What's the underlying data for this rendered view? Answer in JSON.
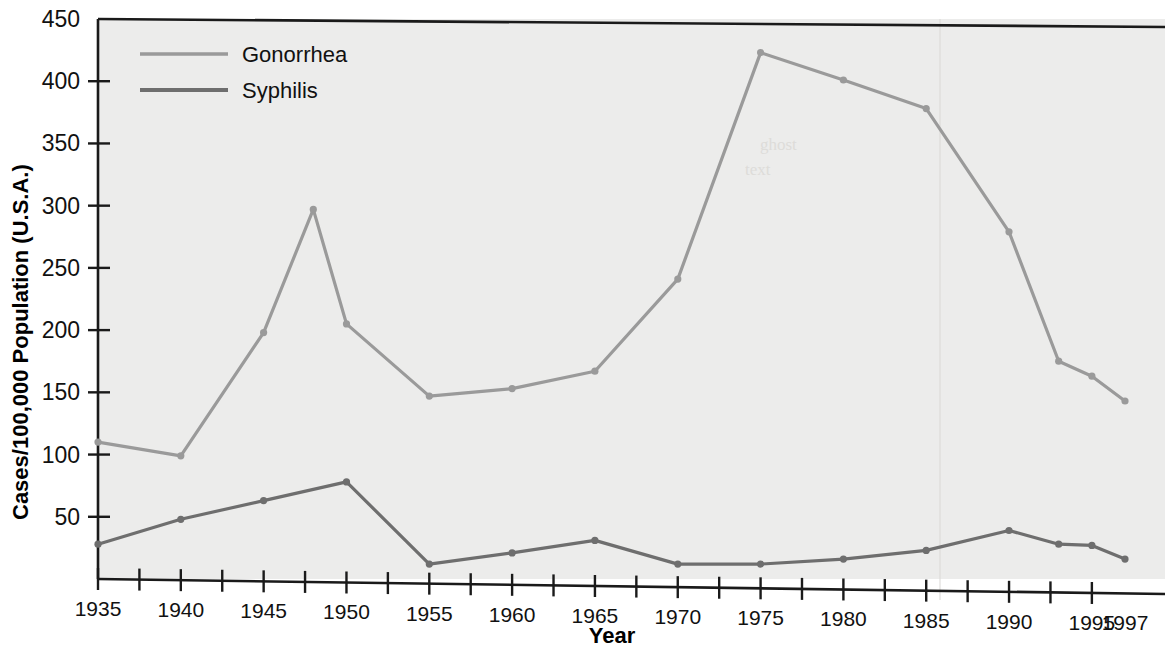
{
  "chart_data": {
    "type": "line",
    "title": "",
    "xlabel": "Year",
    "ylabel": "Cases/100,000 Population (U.S.A.)",
    "xlim": [
      1935,
      1997
    ],
    "ylim": [
      0,
      450
    ],
    "yticks": [
      50,
      100,
      150,
      200,
      250,
      300,
      350,
      400,
      450
    ],
    "xticks": [
      1935,
      1940,
      1945,
      1950,
      1955,
      1960,
      1965,
      1970,
      1975,
      1980,
      1985,
      1990,
      1995,
      1997
    ],
    "xtick_labels": [
      "1935",
      "1940",
      "1945",
      "1950",
      "1955",
      "1960",
      "1965",
      "1970",
      "1975",
      "1980",
      "1985",
      "1990",
      "1995",
      "1997"
    ],
    "ytick_labels": [
      "50",
      "100",
      "150",
      "200",
      "250",
      "300",
      "350",
      "400",
      "450"
    ],
    "minor_xtick_interval": 2.5,
    "grid": false,
    "legend_position": "top-left",
    "series": [
      {
        "name": "Gonorrhea",
        "color": "#9a9a9a",
        "x": [
          1935,
          1940,
          1945,
          1948,
          1950,
          1955,
          1960,
          1965,
          1970,
          1975,
          1980,
          1985,
          1990,
          1993,
          1995,
          1997
        ],
        "values": [
          110,
          99,
          198,
          297,
          205,
          147,
          153,
          167,
          241,
          423,
          401,
          378,
          279,
          175,
          163,
          143
        ]
      },
      {
        "name": "Syphilis",
        "color": "#6e6e6e",
        "x": [
          1935,
          1940,
          1945,
          1950,
          1955,
          1960,
          1965,
          1970,
          1975,
          1980,
          1985,
          1990,
          1993,
          1995,
          1997
        ],
        "values": [
          28,
          48,
          63,
          78,
          12,
          21,
          31,
          12,
          12,
          16,
          23,
          39,
          28,
          27,
          16
        ]
      }
    ]
  },
  "legend": {
    "entries": [
      {
        "label": "Gonorrhea",
        "color": "#9a9a9a"
      },
      {
        "label": "Syphilis",
        "color": "#6e6e6e"
      }
    ]
  },
  "axes": {
    "y_title": "Cases/100,000 Population (U.S.A.)",
    "x_title": "Year"
  },
  "colors": {
    "plot_background": "#ececeb",
    "axis": "#1a1a1a",
    "gonorrhea": "#9a9a9a",
    "syphilis": "#6e6e6e"
  }
}
